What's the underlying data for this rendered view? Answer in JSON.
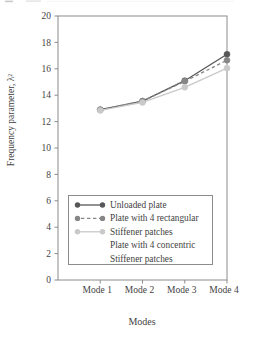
{
  "figure": {
    "width": 255,
    "height": 338,
    "background": "#ffffff",
    "axis_color": "#8c8c8c",
    "text_color": "#3f3f3f"
  },
  "chart_data": {
    "type": "line",
    "title": "",
    "xlabel": "Modes",
    "ylabel": "Frequency parameter, λ²",
    "categories": [
      "Mode 1",
      "Mode 2",
      "Mode 3",
      "Mode 4"
    ],
    "ylim": [
      0,
      20
    ],
    "ytick_step": 2,
    "ytick_labels": [
      "0",
      "2",
      "4",
      "6",
      "8",
      "10",
      "12",
      "14",
      "16",
      "18",
      "20"
    ],
    "grid": false,
    "plot_border": true,
    "legend_position": "inside-lower-left",
    "series": [
      {
        "name": "Unloaded plate",
        "values": [
          12.9,
          13.55,
          15.1,
          17.1
        ],
        "color": "#575757",
        "line_style": "solid",
        "marker": "circle"
      },
      {
        "name": "Plate with 4 rectangular Stiffener patches",
        "values": [
          12.9,
          13.55,
          15.05,
          16.65
        ],
        "color": "#868686",
        "line_style": "dashed",
        "marker": "circle"
      },
      {
        "name": "Plate with 4 concentric Stiffener patches",
        "values": [
          12.85,
          13.45,
          14.6,
          16.05
        ],
        "color": "#c9c9c9",
        "line_style": "solid",
        "marker": "circle"
      }
    ],
    "legend": {
      "rows": [
        {
          "key_series": 0,
          "text": "Unloaded plate"
        },
        {
          "key_series": 1,
          "text": "Plate with 4 rectangular"
        },
        {
          "key_series": 2,
          "text": "Stiffener patches"
        },
        {
          "key_series": null,
          "text": "Plate with 4 concentric"
        },
        {
          "key_series": null,
          "text": "Stiffener patches"
        }
      ]
    }
  }
}
